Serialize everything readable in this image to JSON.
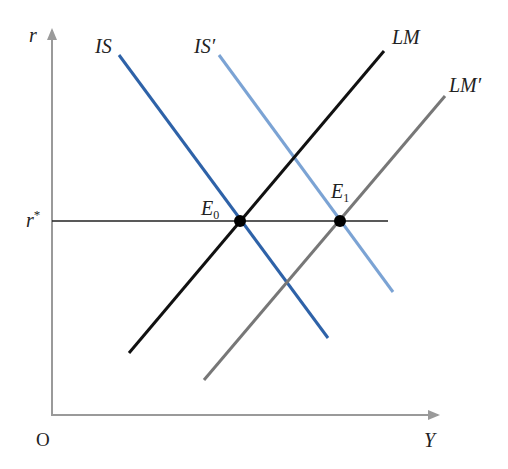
{
  "diagram": {
    "type": "IS-LM diagram",
    "axes": {
      "y_label": "r",
      "x_label": "Y",
      "origin_label": "O",
      "axis_color": "#9a9a9a"
    },
    "reference_line": {
      "label": "r*",
      "label_base": "r",
      "label_sup": "*",
      "color": "#222222"
    },
    "curves": [
      {
        "id": "IS",
        "label": "IS",
        "color": "#2e62a8",
        "x1": 119,
        "y1": 55,
        "x2": 328,
        "y2": 338
      },
      {
        "id": "IS_prime",
        "label": "IS′",
        "color": "#7ba3d4",
        "x1": 219,
        "y1": 55,
        "x2": 393,
        "y2": 292
      },
      {
        "id": "LM",
        "label": "LM",
        "color": "#111111",
        "x1": 384,
        "y1": 51,
        "x2": 129,
        "y2": 353
      },
      {
        "id": "LM_prime",
        "label": "LM′",
        "color": "#777777",
        "x1": 445,
        "y1": 96,
        "x2": 204,
        "y2": 380
      }
    ],
    "equilibria": [
      {
        "id": "E0",
        "label_base": "E",
        "label_sub": "0",
        "x": 240,
        "y": 221
      },
      {
        "id": "E1",
        "label_base": "E",
        "label_sub": "1",
        "x": 340,
        "y": 221
      }
    ]
  }
}
